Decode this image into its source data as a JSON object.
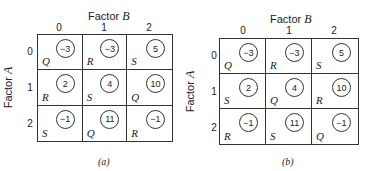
{
  "panels": [
    {
      "caption": "(a)",
      "col_axis": {
        "label_prefix": "Factor ",
        "label_var": "B",
        "ticks": [
          "0",
          "1",
          "2"
        ]
      },
      "row_axis": {
        "label_prefix": "Factor ",
        "label_var": "A",
        "ticks": [
          "0",
          "1",
          "2"
        ]
      },
      "cells": [
        [
          {
            "value": "−3",
            "letter": "Q"
          },
          {
            "value": "−3",
            "letter": "R"
          },
          {
            "value": "5",
            "letter": "S"
          }
        ],
        [
          {
            "value": "2",
            "letter": "R"
          },
          {
            "value": "4",
            "letter": "S"
          },
          {
            "value": "10",
            "letter": "Q"
          }
        ],
        [
          {
            "value": "−1",
            "letter": "S"
          },
          {
            "value": "11",
            "letter": "Q"
          },
          {
            "value": "−1",
            "letter": "R"
          }
        ]
      ]
    },
    {
      "caption": "(b)",
      "col_axis": {
        "label_prefix": "Factor ",
        "label_var": "B",
        "ticks": [
          "0",
          "1",
          "2"
        ]
      },
      "row_axis": {
        "label_prefix": "Factor ",
        "label_var": "A",
        "ticks": [
          "0",
          "1",
          "2"
        ]
      },
      "cells": [
        [
          {
            "value": "−3",
            "letter": "Q"
          },
          {
            "value": "−3",
            "letter": "R"
          },
          {
            "value": "5",
            "letter": "S"
          }
        ],
        [
          {
            "value": "2",
            "letter": "S"
          },
          {
            "value": "4",
            "letter": "Q"
          },
          {
            "value": "10",
            "letter": "R"
          }
        ],
        [
          {
            "value": "−1",
            "letter": "R"
          },
          {
            "value": "11",
            "letter": "S"
          },
          {
            "value": "−1",
            "letter": "Q"
          }
        ]
      ]
    }
  ]
}
